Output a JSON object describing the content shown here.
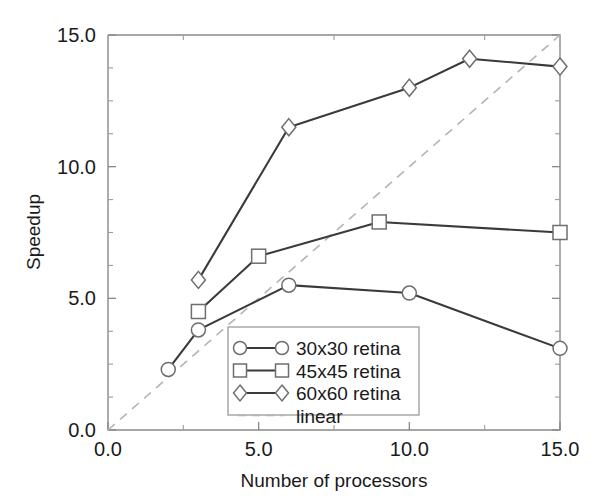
{
  "chart_data": {
    "type": "line",
    "title": "",
    "subtitle": "",
    "xlabel": "Number of processors",
    "ylabel": "Speedup",
    "xlim": [
      0.0,
      15.0
    ],
    "ylim": [
      0.0,
      15.0
    ],
    "xticks": [
      0.0,
      5.0,
      10.0,
      15.0
    ],
    "xticklabels": [
      "0.0",
      "5.0",
      "10.0",
      "15.0"
    ],
    "yticks": [
      0.0,
      5.0,
      10.0,
      15.0
    ],
    "yticklabels": [
      "0.0",
      "5.0",
      "10.0",
      "15.0"
    ],
    "xminorticks": [
      2.5,
      7.5,
      12.5
    ],
    "yminorticks": [
      1.25,
      2.5,
      3.75,
      6.25,
      7.5,
      8.75,
      11.25,
      12.5,
      13.75
    ],
    "grid": false,
    "legend_position": "lower center",
    "series": [
      {
        "name": "30x30 retina",
        "marker": "circle",
        "linestyle": "solid",
        "x": [
          2,
          3,
          6,
          10,
          15
        ],
        "y": [
          2.3,
          3.8,
          5.5,
          5.2,
          3.1
        ]
      },
      {
        "name": "45x45 retina",
        "marker": "square",
        "linestyle": "solid",
        "x": [
          3,
          5,
          9,
          15
        ],
        "y": [
          4.5,
          6.6,
          7.9,
          7.5
        ]
      },
      {
        "name": "60x60 retina",
        "marker": "diamond",
        "linestyle": "solid",
        "x": [
          3,
          6,
          10,
          12,
          15
        ],
        "y": [
          5.7,
          11.5,
          13.0,
          14.1,
          13.8
        ]
      },
      {
        "name": "linear",
        "marker": "none",
        "linestyle": "dashed",
        "x": [
          0,
          15
        ],
        "y": [
          0,
          15
        ]
      }
    ]
  },
  "colors": {
    "series_line": "#3a3a3a",
    "marker_edge": "#6e6e6e",
    "marker_face": "#ffffff",
    "linear_line": "#b4b4b4",
    "axis": "#8a8a8a",
    "text": "#1a1a1a",
    "background": "#ffffff"
  },
  "legend": {
    "entries": [
      {
        "label": "30x30 retina",
        "marker": "circle-icon",
        "style": "solid"
      },
      {
        "label": "45x45 retina",
        "marker": "square-icon",
        "style": "solid"
      },
      {
        "label": "60x60 retina",
        "marker": "diamond-icon",
        "style": "solid"
      },
      {
        "label": "linear",
        "marker": "none",
        "style": "dashed"
      }
    ]
  }
}
